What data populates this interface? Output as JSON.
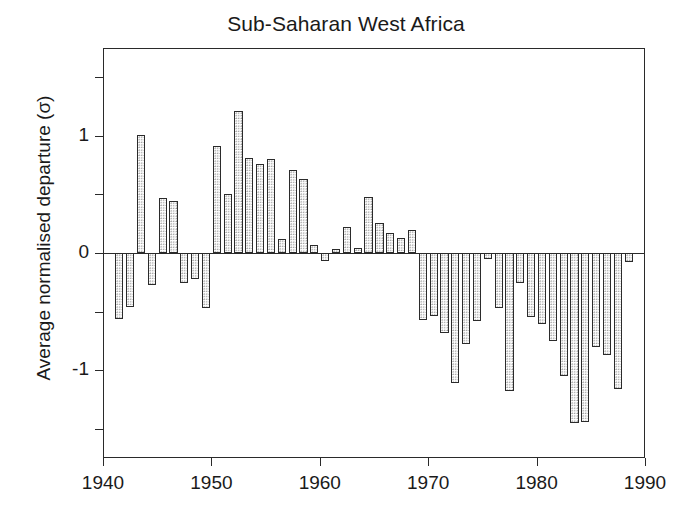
{
  "chart_data": {
    "type": "bar",
    "title": "Sub-Saharan West Africa",
    "xlabel": "",
    "ylabel": "Average normalised departure  (σ)",
    "xlim": [
      1940,
      1990
    ],
    "ylim": [
      -1.75,
      1.75
    ],
    "grid": false,
    "legend": null,
    "x_ticks": [
      1940,
      1950,
      1960,
      1970,
      1980,
      1990
    ],
    "x_tick_labels": [
      "1940",
      "1950",
      "1960",
      "1970",
      "1980",
      "1990"
    ],
    "y_ticks": [
      -1.5,
      -1,
      -0.5,
      0,
      0.5,
      1,
      1.5
    ],
    "y_tick_labels": [
      "",
      "-1",
      "",
      "0",
      "",
      "1",
      ""
    ],
    "x": [
      1941,
      1942,
      1943,
      1944,
      1945,
      1946,
      1947,
      1948,
      1949,
      1950,
      1951,
      1952,
      1953,
      1954,
      1955,
      1956,
      1957,
      1958,
      1959,
      1960,
      1961,
      1962,
      1963,
      1964,
      1965,
      1966,
      1967,
      1968,
      1969,
      1970,
      1971,
      1972,
      1973,
      1974,
      1975,
      1976,
      1977,
      1978,
      1979,
      1980,
      1981,
      1982,
      1983,
      1984,
      1985,
      1986,
      1987,
      1988
    ],
    "values": [
      -0.56,
      -0.46,
      1.01,
      -0.27,
      0.47,
      0.44,
      -0.26,
      -0.22,
      -0.47,
      0.91,
      0.5,
      1.21,
      0.81,
      0.76,
      0.8,
      0.12,
      0.71,
      0.63,
      0.07,
      -0.07,
      0.03,
      0.22,
      0.04,
      0.48,
      0.26,
      0.17,
      0.13,
      0.2,
      -0.57,
      -0.54,
      -0.68,
      -1.11,
      -0.78,
      -0.58,
      -0.05,
      -0.47,
      -1.18,
      -0.26,
      -0.55,
      -0.61,
      -0.75,
      -1.05,
      -1.45,
      -1.44,
      -0.8,
      -0.87,
      -1.16,
      -0.08
    ],
    "series_name": "Average normalised departure",
    "bar_fill": "#ffffff",
    "bar_edge": "#2b2b2b",
    "bar_texture": "dotted-stipple"
  },
  "figure": {
    "background": "#ffffff",
    "axis_color": "#2a2a2a",
    "text_color": "#1a1a1a"
  }
}
